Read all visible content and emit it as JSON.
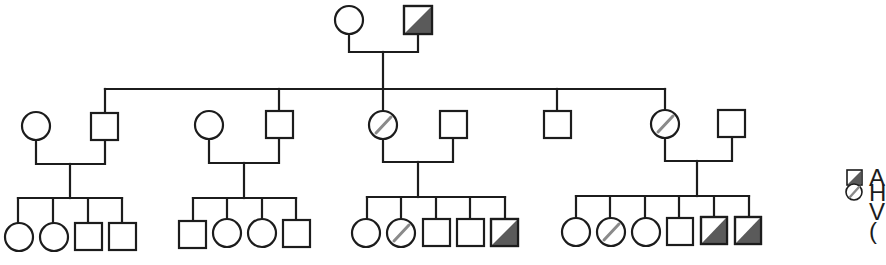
{
  "diagram": {
    "type": "pedigree",
    "colors": {
      "line": "#1c1c1c",
      "affected_fill": "#5a5a5a",
      "carrier_slash": "#8a8a8a",
      "background": "#ffffff"
    },
    "generation_1": {
      "couple": [
        {
          "sex": "female",
          "status": "unaffected"
        },
        {
          "sex": "male",
          "status": "affected"
        }
      ]
    },
    "generation_2": [
      {
        "spouse": {
          "sex": "female",
          "status": "unaffected"
        },
        "child": {
          "sex": "male",
          "status": "unaffected"
        },
        "offspring": [
          {
            "sex": "female",
            "status": "unaffected"
          },
          {
            "sex": "female",
            "status": "unaffected"
          },
          {
            "sex": "male",
            "status": "unaffected"
          },
          {
            "sex": "male",
            "status": "unaffected"
          }
        ]
      },
      {
        "spouse": {
          "sex": "female",
          "status": "unaffected"
        },
        "child": {
          "sex": "male",
          "status": "unaffected"
        },
        "offspring": [
          {
            "sex": "male",
            "status": "unaffected"
          },
          {
            "sex": "female",
            "status": "unaffected"
          },
          {
            "sex": "female",
            "status": "unaffected"
          },
          {
            "sex": "male",
            "status": "unaffected"
          }
        ]
      },
      {
        "child": {
          "sex": "female",
          "status": "carrier"
        },
        "spouse": {
          "sex": "male",
          "status": "unaffected"
        },
        "offspring": [
          {
            "sex": "female",
            "status": "unaffected"
          },
          {
            "sex": "female",
            "status": "carrier"
          },
          {
            "sex": "male",
            "status": "unaffected"
          },
          {
            "sex": "male",
            "status": "unaffected"
          },
          {
            "sex": "male",
            "status": "affected"
          }
        ]
      },
      {
        "child": {
          "sex": "male",
          "status": "unaffected"
        },
        "spouse": null,
        "offspring": []
      },
      {
        "child": {
          "sex": "female",
          "status": "carrier"
        },
        "spouse": {
          "sex": "male",
          "status": "unaffected"
        },
        "offspring": [
          {
            "sex": "female",
            "status": "unaffected"
          },
          {
            "sex": "female",
            "status": "carrier"
          },
          {
            "sex": "female",
            "status": "unaffected"
          },
          {
            "sex": "male",
            "status": "unaffected"
          },
          {
            "sex": "male",
            "status": "affected"
          },
          {
            "sex": "male",
            "status": "affected"
          }
        ]
      }
    ]
  },
  "legend": {
    "items": [
      {
        "symbol": "affected-male-half-shaded-square",
        "label_visible": "A"
      },
      {
        "symbol": "carrier-female-slashed-circle",
        "label_visible": "H"
      },
      {
        "symbol": "continuation",
        "label_visible": "V"
      },
      {
        "symbol": "continuation",
        "label_visible": "("
      }
    ]
  }
}
